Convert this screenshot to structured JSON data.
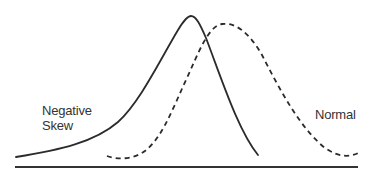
{
  "diagram": {
    "labels": {
      "negative_skew_line1": "Negative",
      "negative_skew_line2": "Skew",
      "normal": "Normal"
    },
    "curves": [
      {
        "name": "negative-skew",
        "style": "solid",
        "color": "#2b2b2b"
      },
      {
        "name": "normal",
        "style": "dashed",
        "color": "#2b2b2b"
      }
    ],
    "baseline": {
      "color": "#333333"
    }
  }
}
